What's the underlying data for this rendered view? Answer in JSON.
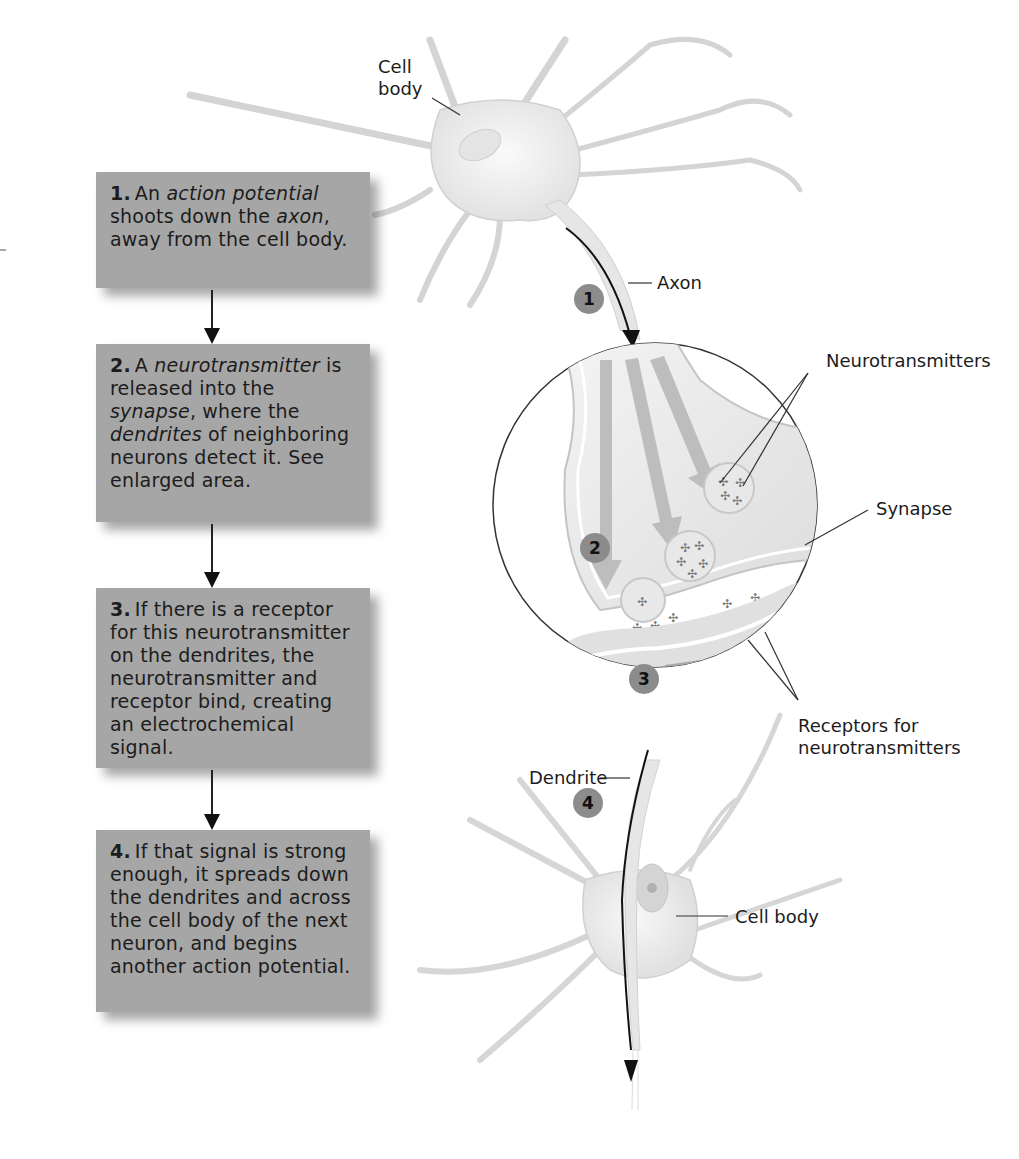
{
  "steps": [
    {
      "number": "1.",
      "segments": [
        {
          "text": "An ",
          "italic": false
        },
        {
          "text": "action potential",
          "italic": true
        },
        {
          "text": " shoots down the ",
          "italic": false
        },
        {
          "text": "axon",
          "italic": true
        },
        {
          "text": ", away from the cell body.",
          "italic": false
        }
      ]
    },
    {
      "number": "2.",
      "segments": [
        {
          "text": "A ",
          "italic": false
        },
        {
          "text": "neurotransmitter",
          "italic": true
        },
        {
          "text": " is released into the ",
          "italic": false
        },
        {
          "text": "synapse",
          "italic": true
        },
        {
          "text": ", where the ",
          "italic": false
        },
        {
          "text": "dendrites",
          "italic": true
        },
        {
          "text": " of neighboring neurons detect it. See enlarged area.",
          "italic": false
        }
      ]
    },
    {
      "number": "3.",
      "segments": [
        {
          "text": "If there is a receptor for this neurotransmitter on the dendrites, the neurotransmitter and receptor bind, creating an electrochemical signal.",
          "italic": false
        }
      ]
    },
    {
      "number": "4.",
      "segments": [
        {
          "text": "If that signal is strong enough, it spreads down the dendrites and across the cell body of the next neuron, and begins another action potential.",
          "italic": false
        }
      ]
    }
  ],
  "labels": {
    "cell_body_top_line1": "Cell",
    "cell_body_top_line2": "body",
    "axon": "Axon",
    "neurotransmitters": "Neurotransmitters",
    "synapse": "Synapse",
    "receptors_line1": "Receptors for",
    "receptors_line2": "neurotransmitters",
    "dendrite": "Dendrite",
    "cell_body_bottom": "Cell body"
  },
  "badges": [
    "1",
    "2",
    "3",
    "4"
  ],
  "colors": {
    "box_fill": "#a6a6a6",
    "badge_fill": "#8c8c8c",
    "neuron_fill": "#ececec",
    "neuron_outline": "#c8c8c8",
    "arrow": "#111111"
  }
}
